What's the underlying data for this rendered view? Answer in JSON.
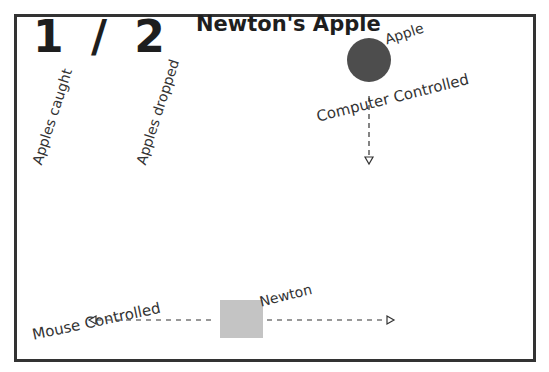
{
  "game": {
    "title": "Newton's Apple",
    "score": {
      "caught": "1",
      "separator": "/",
      "dropped": "2",
      "display": "1 / 2"
    },
    "labels": {
      "apples_caught": "Apples caught",
      "apples_dropped": "Apples dropped",
      "apple": "Apple",
      "computer_controlled": "Computer Controlled",
      "newton": "Newton",
      "mouse_controlled": "Mouse  Controlled"
    },
    "sprites": {
      "apple": {
        "shape": "circle",
        "color": "#4d4d4d"
      },
      "newton": {
        "shape": "square",
        "color": "#c4c4c4"
      }
    },
    "icons": {
      "apple_direction": "arrow-down-icon",
      "newton_left": "arrow-left-icon",
      "newton_right": "arrow-right-icon"
    },
    "colors": {
      "frame": "#333333",
      "text": "#1e1e1e",
      "background": "#ffffff"
    }
  }
}
